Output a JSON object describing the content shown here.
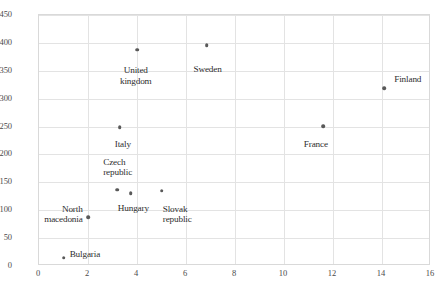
{
  "chart_data": {
    "type": "scatter",
    "title": "",
    "xlabel": "",
    "ylabel": "",
    "xlim": [
      0,
      16
    ],
    "ylim": [
      0,
      450
    ],
    "xticks": [
      0,
      2,
      4,
      6,
      8,
      10,
      12,
      14,
      16
    ],
    "yticks": [
      0,
      50,
      100,
      150,
      200,
      250,
      300,
      350,
      400,
      450
    ],
    "grid": true,
    "legend": "none",
    "marker_color": "#595959",
    "gridline_color": "#e3e3e3",
    "border_color": "#d9d9d9",
    "points": [
      {
        "label": "Bulgaria",
        "x": 1.0,
        "y": 15,
        "lx": 1.25,
        "ly": 30,
        "align": "left"
      },
      {
        "label": "North\nmacedonia",
        "x": 2.0,
        "y": 88,
        "lx": 1.78,
        "ly": 112,
        "align": "right"
      },
      {
        "label": "Czech\nrepublic",
        "x": 3.2,
        "y": 137,
        "lx": 2.62,
        "ly": 196,
        "align": "left"
      },
      {
        "label": "Hungary",
        "x": 3.75,
        "y": 131,
        "lx": 3.85,
        "ly": 113,
        "align": "center"
      },
      {
        "label": "Slovak\nrepublic",
        "x": 5.0,
        "y": 135,
        "lx": 5.05,
        "ly": 112,
        "align": "left"
      },
      {
        "label": "Italy",
        "x": 3.3,
        "y": 249,
        "lx": 3.42,
        "ly": 228,
        "align": "center"
      },
      {
        "label": "United\nkingdom",
        "x": 4.0,
        "y": 388,
        "lx": 3.95,
        "ly": 360,
        "align": "center"
      },
      {
        "label": "Sweden",
        "x": 6.85,
        "y": 396,
        "lx": 6.88,
        "ly": 362,
        "align": "center"
      },
      {
        "label": "France",
        "x": 11.6,
        "y": 251,
        "lx": 11.3,
        "ly": 228,
        "align": "center"
      },
      {
        "label": "Finland",
        "x": 14.1,
        "y": 319,
        "lx": 14.5,
        "ly": 344,
        "align": "left"
      }
    ]
  }
}
